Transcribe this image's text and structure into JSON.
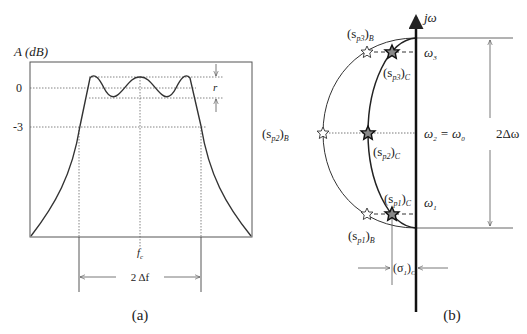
{
  "panel_a": {
    "y_axis_label": "A (dB)",
    "ticks": {
      "zero": "0",
      "minus3": "-3"
    },
    "ripple_label": "r",
    "center_freq_label": "f",
    "center_freq_sub": "c",
    "bandwidth_label": "2 Δf",
    "caption": "(a)"
  },
  "panel_b": {
    "axis_label": "jω",
    "omega3": "ω",
    "omega3_sub": "3",
    "omega2_expr": "ω",
    "omega2_sub": "2",
    "omega2_eq": " = ω",
    "omega0_sub": "0",
    "omega1": "ω",
    "omega1_sub": "1",
    "bandwidth_label": "2Δω",
    "sp3B": {
      "base": "(s",
      "sub": "p3",
      "close": ")",
      "outer": "B"
    },
    "sp3C": {
      "base": "(s",
      "sub": "p3",
      "close": ")",
      "outer": "C"
    },
    "sp2B": {
      "base": "(s",
      "sub": "p2",
      "close": ")",
      "outer": "B"
    },
    "sp2C": {
      "base": "(s",
      "sub": "p2",
      "close": ")",
      "outer": "C"
    },
    "sp1C": {
      "base": "(s",
      "sub": "p1",
      "close": ")",
      "outer": "C"
    },
    "sp1B": {
      "base": "(s",
      "sub": "p1",
      "close": ")",
      "outer": "B"
    },
    "sigma1C": {
      "base": "(σ",
      "sub": "1",
      "close": ")",
      "outer": "C"
    },
    "caption": "(b)"
  },
  "colors": {
    "line": "#333333",
    "dotted": "#555555",
    "background": "#ffffff"
  }
}
